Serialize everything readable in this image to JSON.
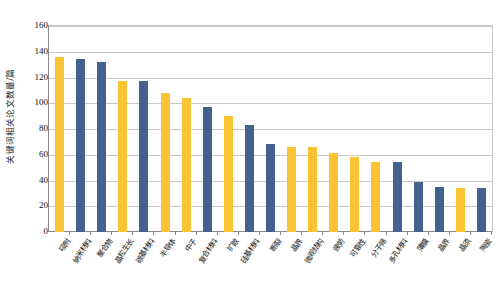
{
  "chart_data": {
    "type": "bar",
    "title": "",
    "subtitle": "",
    "xlabel": "",
    "ylabel": "关键词相关论文数量/篇",
    "ylim": [
      0,
      160
    ],
    "yticks": [
      0,
      20,
      40,
      60,
      80,
      100,
      120,
      140,
      160
    ],
    "ytick_labels": [
      "0",
      "20",
      "40",
      "60",
      "80",
      "100",
      "120",
      "140",
      "160"
    ],
    "grid": true,
    "grid_axis": "y",
    "legend": false,
    "legend_position": "none",
    "colors": {
      "yellow": "#F9C333",
      "blue": "#44628F",
      "gridline": "#C9C9C9",
      "axis": "#8A8A8A",
      "text": "#111111",
      "background": "#FFFFFF"
    },
    "categories": [
      "吸附",
      "纳米材料",
      "聚合物",
      "晶粒生长",
      "碳基材料",
      "半导体",
      "中子",
      "复合材料",
      "扩散",
      "硅基材料",
      "断裂",
      "晶界",
      "微观结构",
      "疲劳",
      "可靠性",
      "分子筛",
      "多孔材料",
      "薄膜",
      "晶界",
      "晶须",
      "陶瓷"
    ],
    "values": [
      136,
      134,
      132,
      117,
      117,
      108,
      104,
      97,
      90,
      83,
      68,
      66,
      66,
      61,
      58,
      54,
      54,
      39,
      35,
      34,
      34
    ],
    "bar_colors": [
      "yellow",
      "blue",
      "blue",
      "yellow",
      "blue",
      "yellow",
      "yellow",
      "blue",
      "yellow",
      "blue",
      "blue",
      "yellow",
      "yellow",
      "yellow",
      "yellow",
      "yellow",
      "blue",
      "blue",
      "blue",
      "yellow",
      "blue"
    ]
  }
}
